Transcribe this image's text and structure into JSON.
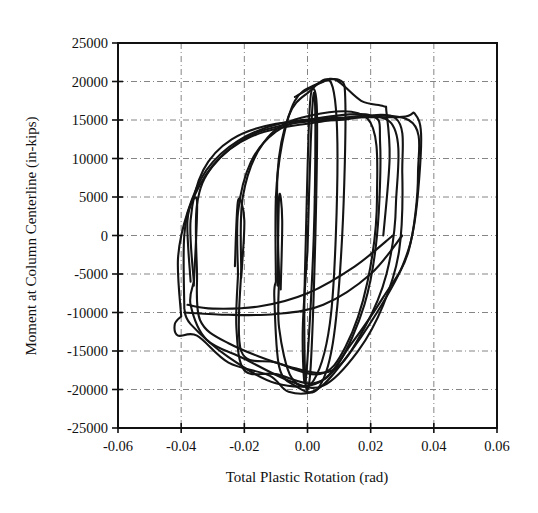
{
  "chart_data": {
    "type": "line",
    "title": "",
    "xlabel": "Total Plastic Rotation (rad)",
    "ylabel": "Moment at Column Centerline (in-kips)",
    "xlim": [
      -0.06,
      0.06
    ],
    "ylim": [
      -25000,
      25000
    ],
    "x_ticks": [
      "-0.06",
      "-0.04",
      "-0.02",
      "0.00",
      "0.02",
      "0.04",
      "0.06"
    ],
    "y_ticks": [
      "25000",
      "20000",
      "15000",
      "10000",
      "5000",
      "0",
      "-5000",
      "-10000",
      "-15000",
      "-20000",
      "-25000"
    ],
    "grid": true,
    "legend": null,
    "series": [
      {
        "name": "Hysteresis response (cyclic loading)",
        "description": "Cyclic moment-rotation hysteresis loops; approximate envelope points",
        "points": [
          [
            0.0,
            0
          ],
          [
            0.002,
            18000
          ],
          [
            0.0,
            0
          ],
          [
            -0.002,
            -18000
          ],
          [
            0.0,
            0
          ],
          [
            -0.01,
            -6000
          ],
          [
            -0.009,
            18000
          ],
          [
            0.01,
            20000
          ],
          [
            0.004,
            -20000
          ],
          [
            -0.01,
            -20000
          ],
          [
            -0.022,
            -5000
          ],
          [
            -0.02,
            12000
          ],
          [
            0.02,
            15500
          ],
          [
            0.022,
            0
          ],
          [
            0.01,
            -19000
          ],
          [
            -0.022,
            -17500
          ],
          [
            -0.036,
            -6000
          ],
          [
            -0.034,
            10000
          ],
          [
            0.028,
            15000
          ],
          [
            0.03,
            0
          ],
          [
            0.0,
            -20000
          ],
          [
            -0.04,
            -10500
          ],
          [
            -0.04,
            -3000
          ],
          [
            -0.028,
            10000
          ],
          [
            0.035,
            15800
          ],
          [
            0.036,
            12000
          ],
          [
            0.03,
            -5000
          ],
          [
            0.0,
            -20300
          ],
          [
            -0.015,
            -18000
          ],
          [
            -0.035,
            -13000
          ],
          [
            -0.041,
            -12800
          ],
          [
            -0.042,
            -3500
          ]
        ],
        "peak_positive_moment": 20000,
        "peak_negative_moment": -20300,
        "max_rotation": 0.036,
        "min_rotation": -0.042
      }
    ]
  }
}
